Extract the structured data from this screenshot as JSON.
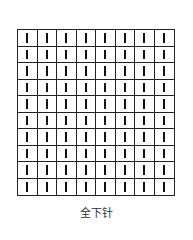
{
  "diagram": {
    "type": "knitting-chart",
    "columns": 8,
    "rows": 10,
    "symbol": "knit-stitch-vertical-bar",
    "line_color": "#222222",
    "caption": "全下针"
  }
}
